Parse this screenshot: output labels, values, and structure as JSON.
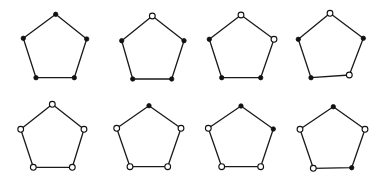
{
  "diagram": {
    "background": "#ffffff",
    "stroke_color": "#1a1a1a",
    "vertex_order": [
      "top",
      "right",
      "bottom-right",
      "bottom-left",
      "left"
    ],
    "vertex_radius": {
      "filled": 2.2,
      "open": 2.9
    },
    "pentagons": [
      {
        "id": "pentagon-1",
        "vertices": [
          [
            55.7,
            14.3
          ],
          [
            86.7,
            39.0
          ],
          [
            74.3,
            77.7
          ],
          [
            36.0,
            77.7
          ],
          [
            23.3,
            38.3
          ]
        ],
        "states": [
          "filled",
          "filled",
          "filled",
          "filled",
          "filled"
        ]
      },
      {
        "id": "pentagon-2",
        "vertices": [
          [
            152.3,
            16.0
          ],
          [
            184.0,
            40.7
          ],
          [
            171.7,
            79.0
          ],
          [
            132.7,
            79.0
          ],
          [
            121.7,
            40.7
          ]
        ],
        "states": [
          "open",
          "filled",
          "filled",
          "filled",
          "filled"
        ]
      },
      {
        "id": "pentagon-3",
        "vertices": [
          [
            241.0,
            15.0
          ],
          [
            274.0,
            39.3
          ],
          [
            260.7,
            77.7
          ],
          [
            221.7,
            77.7
          ],
          [
            209.3,
            39.3
          ]
        ],
        "states": [
          "open",
          "open",
          "filled",
          "filled",
          "filled"
        ]
      },
      {
        "id": "pentagon-4",
        "vertices": [
          [
            330.0,
            13.3
          ],
          [
            363.3,
            38.3
          ],
          [
            349.3,
            75.0
          ],
          [
            311.0,
            77.7
          ],
          [
            298.3,
            39.3
          ]
        ],
        "states": [
          "open",
          "filled",
          "open",
          "filled",
          "filled"
        ]
      },
      {
        "id": "pentagon-5",
        "vertices": [
          [
            52.3,
            104.3
          ],
          [
            84.0,
            129.3
          ],
          [
            72.3,
            167.3
          ],
          [
            33.3,
            167.3
          ],
          [
            20.7,
            129.3
          ]
        ],
        "states": [
          "open",
          "open",
          "open",
          "open",
          "open"
        ]
      },
      {
        "id": "pentagon-6",
        "vertices": [
          [
            149.0,
            105.7
          ],
          [
            181.0,
            128.3
          ],
          [
            167.7,
            166.7
          ],
          [
            130.0,
            166.7
          ],
          [
            116.7,
            128.3
          ]
        ],
        "states": [
          "filled",
          "open",
          "open",
          "open",
          "open"
        ]
      },
      {
        "id": "pentagon-7",
        "vertices": [
          [
            241.0,
            106.0
          ],
          [
            273.3,
            129.0
          ],
          [
            260.7,
            166.7
          ],
          [
            221.7,
            166.7
          ],
          [
            208.3,
            128.3
          ]
        ],
        "states": [
          "filled",
          "filled",
          "open",
          "open",
          "open"
        ]
      },
      {
        "id": "pentagon-8",
        "vertices": [
          [
            333.3,
            106.7
          ],
          [
            365.0,
            129.3
          ],
          [
            351.7,
            167.7
          ],
          [
            313.3,
            168.3
          ],
          [
            300.0,
            129.3
          ]
        ],
        "states": [
          "filled",
          "open",
          "filled",
          "open",
          "open"
        ]
      }
    ]
  }
}
